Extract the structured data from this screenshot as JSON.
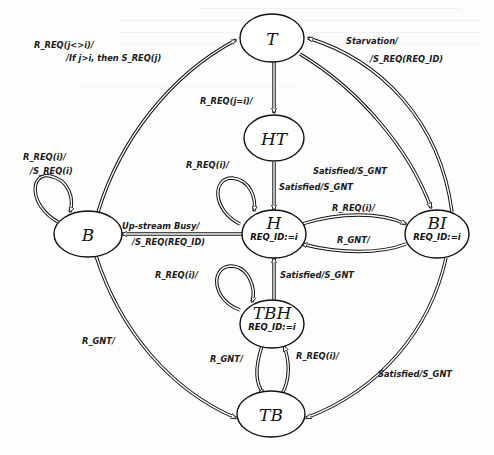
{
  "diagram": {
    "type": "state-machine",
    "states": [
      {
        "id": "T",
        "label": "T",
        "sub": ""
      },
      {
        "id": "HT",
        "label": "HT",
        "sub": ""
      },
      {
        "id": "B",
        "label": "B",
        "sub": ""
      },
      {
        "id": "H",
        "label": "H",
        "sub": "REQ_ID:=i"
      },
      {
        "id": "BI",
        "label": "BI",
        "sub": "REQ_ID:=i"
      },
      {
        "id": "TBH",
        "label": "TBH",
        "sub": "REQ_ID:=i"
      },
      {
        "id": "TB",
        "label": "TB",
        "sub": ""
      }
    ],
    "transitions": [
      {
        "from": "B",
        "to": "T",
        "label1": "R_REQ(j<>i)/",
        "label2": "/If j>i, then S_REQ(j)"
      },
      {
        "from": "T",
        "to": "HT",
        "label1": "R_REQ(j=i)/",
        "label2": ""
      },
      {
        "from": "BI",
        "to": "T",
        "label1": "Starvation/",
        "label2": "/S_REQ(REQ_ID)"
      },
      {
        "from": "T",
        "to": "BI",
        "label1": "Satisfied/S_GNT",
        "label2": ""
      },
      {
        "from": "B",
        "to": "B",
        "label1": "R_REQ(i)/",
        "label2": "/S_REQ(i)"
      },
      {
        "from": "H",
        "to": "H",
        "label1": "R_REQ(i)/",
        "label2": ""
      },
      {
        "from": "HT",
        "to": "H",
        "label1": "Satisfied/S_GNT",
        "label2": ""
      },
      {
        "from": "H",
        "to": "B",
        "label1": "Up-stream Busy/",
        "label2": "/S_REQ(REQ_ID)"
      },
      {
        "from": "H",
        "to": "BI",
        "label1": "R_REQ(i)/",
        "label2": ""
      },
      {
        "from": "BI",
        "to": "H",
        "label1": "R_GNT/",
        "label2": ""
      },
      {
        "from": "TBH",
        "to": "H",
        "label1": "Satisfied/S_GNT",
        "label2": ""
      },
      {
        "from": "TBH",
        "to": "TBH",
        "label1": "R_REQ(i)/",
        "label2": ""
      },
      {
        "from": "TBH",
        "to": "TB",
        "label1": "R_GNT/",
        "label2": ""
      },
      {
        "from": "TB",
        "to": "TBH",
        "label1": "R_REQ(i)/",
        "label2": ""
      },
      {
        "from": "B",
        "to": "TB",
        "label1": "R_GNT/",
        "label2": ""
      },
      {
        "from": "BI",
        "to": "TB",
        "label1": "Satisfied/S_GNT",
        "label2": ""
      }
    ]
  }
}
